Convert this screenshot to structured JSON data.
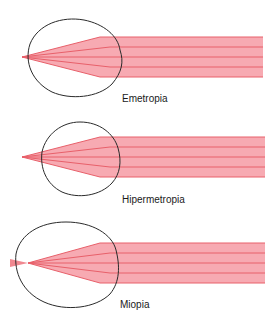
{
  "colors": {
    "beam_fill": "#f7aab2",
    "beam_line": "#e8606a",
    "eye_outline": "#2a2a2a",
    "background": "#ffffff"
  },
  "diagrams": [
    {
      "id": "emetropia",
      "label": "Emetropia",
      "description": "Parallel rays focus exactly on the retina"
    },
    {
      "id": "hipermetropia",
      "label": "Hipermetropia",
      "description": "Parallel rays focus behind the retina (short eye)"
    },
    {
      "id": "miopia",
      "label": "Miopia",
      "description": "Parallel rays focus in front of the retina (long eye)"
    }
  ]
}
